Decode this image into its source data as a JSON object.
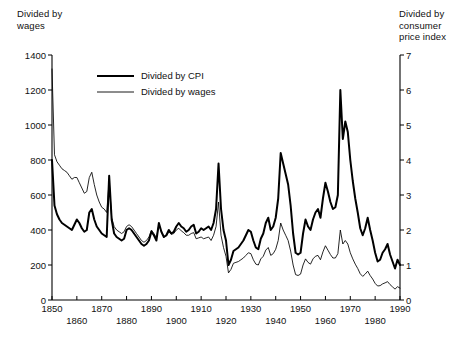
{
  "chart_data": {
    "type": "line",
    "title": "",
    "xlabel": "",
    "left_axis": {
      "label": "Divided by\nwages",
      "ticks": [
        0,
        200,
        400,
        600,
        800,
        1000,
        1200,
        1400
      ],
      "ylim": [
        0,
        1400
      ],
      "series": "Divided by wages"
    },
    "right_axis": {
      "label": "Divided by\nconsumer\nprice index",
      "ticks": [
        0,
        1,
        2,
        3,
        4,
        5,
        6,
        7
      ],
      "ylim": [
        0,
        7
      ],
      "series": "Divided by CPI"
    },
    "xlim": [
      1850,
      1990
    ],
    "xticks": [
      1850,
      1860,
      1870,
      1880,
      1890,
      1900,
      1910,
      1920,
      1930,
      1940,
      1950,
      1960,
      1970,
      1980,
      1990
    ],
    "xtick_labels": [
      "1850",
      "1860",
      "1870",
      "1880",
      "1890",
      "1900",
      "1910",
      "1920",
      "1930",
      "1940",
      "1950",
      "1960",
      "1970",
      "1980",
      "1990"
    ],
    "grid": false,
    "legend_position": "top-center",
    "legend": [
      {
        "name": "Divided by CPI",
        "style": "thick",
        "color": "#000000",
        "axis": "right"
      },
      {
        "name": "Divided by wages",
        "style": "thin",
        "color": "#000000",
        "axis": "left"
      }
    ],
    "series": [
      {
        "name": "Divided by CPI",
        "axis": "right",
        "units": "index (right scale 0-7)",
        "x": [
          1850,
          1851,
          1852,
          1853,
          1854,
          1855,
          1856,
          1857,
          1858,
          1859,
          1860,
          1861,
          1862,
          1863,
          1864,
          1865,
          1866,
          1867,
          1868,
          1869,
          1870,
          1871,
          1872,
          1873,
          1874,
          1875,
          1876,
          1877,
          1878,
          1879,
          1880,
          1881,
          1882,
          1883,
          1884,
          1885,
          1886,
          1887,
          1888,
          1889,
          1890,
          1891,
          1892,
          1893,
          1894,
          1895,
          1896,
          1897,
          1898,
          1899,
          1900,
          1901,
          1902,
          1903,
          1904,
          1905,
          1906,
          1907,
          1908,
          1909,
          1910,
          1911,
          1912,
          1913,
          1914,
          1915,
          1916,
          1917,
          1918,
          1919,
          1920,
          1921,
          1922,
          1923,
          1924,
          1925,
          1926,
          1927,
          1928,
          1929,
          1930,
          1931,
          1932,
          1933,
          1934,
          1935,
          1936,
          1937,
          1938,
          1939,
          1940,
          1941,
          1942,
          1943,
          1944,
          1945,
          1946,
          1947,
          1948,
          1949,
          1950,
          1951,
          1952,
          1953,
          1954,
          1955,
          1956,
          1957,
          1958,
          1959,
          1960,
          1961,
          1962,
          1963,
          1964,
          1965,
          1966,
          1967,
          1968,
          1969,
          1970,
          1971,
          1972,
          1973,
          1974,
          1975,
          1976,
          1977,
          1978,
          1979,
          1980,
          1981,
          1982,
          1983,
          1984,
          1985,
          1986,
          1987,
          1988,
          1989,
          1990
        ],
        "values": [
          4.0,
          2.7,
          2.45,
          2.3,
          2.2,
          2.15,
          2.1,
          2.05,
          2.0,
          2.15,
          2.3,
          2.2,
          2.05,
          1.95,
          2.0,
          2.5,
          2.6,
          2.3,
          2.1,
          2.0,
          1.9,
          1.85,
          1.8,
          3.55,
          2.3,
          1.9,
          1.8,
          1.75,
          1.7,
          1.75,
          2.0,
          2.05,
          2.0,
          1.9,
          1.8,
          1.7,
          1.6,
          1.55,
          1.6,
          1.7,
          1.95,
          1.85,
          1.7,
          2.2,
          1.95,
          1.8,
          1.85,
          2.0,
          1.9,
          1.95,
          2.1,
          2.2,
          2.1,
          2.05,
          1.95,
          2.0,
          2.1,
          2.15,
          1.9,
          1.95,
          2.05,
          2.0,
          2.05,
          2.1,
          2.0,
          2.2,
          2.6,
          3.9,
          2.6,
          2.0,
          1.7,
          1.0,
          1.15,
          1.4,
          1.45,
          1.5,
          1.6,
          1.7,
          1.85,
          2.0,
          1.95,
          1.7,
          1.5,
          1.45,
          1.75,
          1.9,
          2.2,
          2.35,
          2.0,
          2.1,
          2.35,
          2.9,
          4.2,
          3.9,
          3.6,
          3.3,
          2.7,
          1.9,
          1.35,
          1.3,
          1.35,
          1.9,
          2.3,
          2.1,
          2.0,
          2.3,
          2.5,
          2.6,
          2.35,
          2.9,
          3.35,
          3.1,
          2.8,
          2.6,
          2.65,
          3.0,
          6.0,
          4.6,
          5.1,
          4.8,
          4.0,
          3.4,
          2.9,
          2.5,
          2.05,
          1.85,
          2.05,
          2.35,
          2.0,
          1.7,
          1.35,
          1.1,
          1.15,
          1.35,
          1.45,
          1.6,
          1.3,
          1.1,
          0.9,
          1.15,
          1.0
        ]
      },
      {
        "name": "Divided by wages",
        "axis": "left",
        "units": "index (left scale 0-1400)",
        "x": [
          1850,
          1851,
          1852,
          1853,
          1854,
          1855,
          1856,
          1857,
          1858,
          1859,
          1860,
          1861,
          1862,
          1863,
          1864,
          1865,
          1866,
          1867,
          1868,
          1869,
          1870,
          1871,
          1872,
          1873,
          1874,
          1875,
          1876,
          1877,
          1878,
          1879,
          1880,
          1881,
          1882,
          1883,
          1884,
          1885,
          1886,
          1887,
          1888,
          1889,
          1890,
          1891,
          1892,
          1893,
          1894,
          1895,
          1896,
          1897,
          1898,
          1899,
          1900,
          1901,
          1902,
          1903,
          1904,
          1905,
          1906,
          1907,
          1908,
          1909,
          1910,
          1911,
          1912,
          1913,
          1914,
          1915,
          1916,
          1917,
          1918,
          1919,
          1920,
          1921,
          1922,
          1923,
          1924,
          1925,
          1926,
          1927,
          1928,
          1929,
          1930,
          1931,
          1932,
          1933,
          1934,
          1935,
          1936,
          1937,
          1938,
          1939,
          1940,
          1941,
          1942,
          1943,
          1944,
          1945,
          1946,
          1947,
          1948,
          1949,
          1950,
          1951,
          1952,
          1953,
          1954,
          1955,
          1956,
          1957,
          1958,
          1959,
          1960,
          1961,
          1962,
          1963,
          1964,
          1965,
          1966,
          1967,
          1968,
          1969,
          1970,
          1971,
          1972,
          1973,
          1974,
          1975,
          1976,
          1977,
          1978,
          1979,
          1980,
          1981,
          1982,
          1983,
          1984,
          1985,
          1986,
          1987,
          1988,
          1989,
          1990
        ],
        "values": [
          1320,
          830,
          790,
          770,
          750,
          740,
          730,
          710,
          690,
          700,
          700,
          670,
          640,
          610,
          620,
          700,
          730,
          660,
          600,
          560,
          530,
          520,
          500,
          680,
          470,
          420,
          400,
          390,
          380,
          390,
          420,
          430,
          420,
          400,
          380,
          360,
          340,
          330,
          340,
          360,
          400,
          380,
          355,
          430,
          390,
          360,
          365,
          390,
          375,
          380,
          400,
          410,
          395,
          385,
          370,
          370,
          380,
          385,
          350,
          355,
          360,
          350,
          355,
          360,
          340,
          370,
          420,
          560,
          370,
          300,
          250,
          155,
          175,
          210,
          215,
          220,
          230,
          240,
          255,
          270,
          265,
          230,
          205,
          200,
          235,
          250,
          285,
          300,
          255,
          265,
          290,
          340,
          440,
          400,
          370,
          340,
          280,
          200,
          145,
          140,
          148,
          200,
          235,
          215,
          205,
          235,
          250,
          255,
          230,
          275,
          310,
          285,
          260,
          240,
          240,
          265,
          400,
          320,
          340,
          320,
          270,
          235,
          205,
          180,
          150,
          135,
          148,
          165,
          140,
          120,
          95,
          80,
          82,
          92,
          98,
          105,
          88,
          75,
          62,
          76,
          68
        ]
      }
    ]
  },
  "axes_text": {
    "left_title": "Divided by\nwages",
    "right_title": "Divided by\nconsumer\nprice index"
  }
}
